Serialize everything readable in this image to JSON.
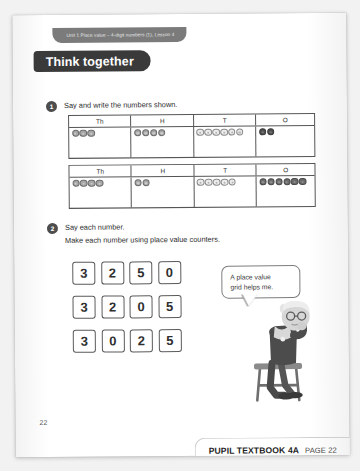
{
  "unit_strip": {
    "text": "Unit 1   Place value – 4-digit numbers (1), Lesson 4"
  },
  "banner": {
    "title": "Think together"
  },
  "questions": [
    {
      "number": "1",
      "prompt": "Say and write the numbers shown.",
      "subprompt": ""
    },
    {
      "number": "2",
      "prompt": "Say each number.",
      "subprompt": "Make each number using place value counters."
    }
  ],
  "place_value_tables": [
    {
      "headers": [
        "Th",
        "H",
        "T",
        "O"
      ],
      "counts": [
        3,
        4,
        6,
        2
      ],
      "styles": [
        "mid",
        "mid",
        "light",
        "darkest"
      ],
      "number": "3462"
    },
    {
      "headers": [
        "Th",
        "H",
        "T",
        "O"
      ],
      "counts": [
        4,
        2,
        5,
        6
      ],
      "styles": [
        "mid",
        "mid",
        "light",
        "dark"
      ],
      "number": "4256"
    }
  ],
  "digit_rows": [
    {
      "digits": [
        "3",
        "2",
        "5",
        "0"
      ]
    },
    {
      "digits": [
        "3",
        "2",
        "0",
        "5"
      ]
    },
    {
      "digits": [
        "3",
        "0",
        "2",
        "5"
      ]
    }
  ],
  "speech_bubble": {
    "line1": "A place value",
    "line2": "grid helps me."
  },
  "page_number": "22",
  "footer": {
    "main": "PUPIL TEXTBOOK 4A",
    "page": "PAGE 22"
  },
  "colors": {
    "banner_bg": "#3a3a3a",
    "unit_strip_bg": "#7b7b7b",
    "page_bg": "#ffffff",
    "backdrop": "#f2f2f2",
    "table_border": "#555555"
  }
}
